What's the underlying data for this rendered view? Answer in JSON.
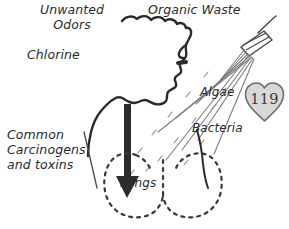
{
  "figure": {
    "background_color": "#ffffff",
    "ink_color": "#2b2b2b"
  },
  "labels": {
    "unwanted_odors": "Unwanted\nOdors",
    "chlorine": "Chlorine",
    "organic_waste": "Organic Waste",
    "algae": "Algae",
    "bacteria": "Bacteria",
    "common_carcinogens": "Common\nCarcinogens\nand toxins",
    "lungs": "Lungs"
  },
  "badge": {
    "number": "119",
    "shape": "heart",
    "fill_color": "#d8d8d8",
    "stroke_color": "#6e6e6e",
    "text_color": "#3a3a3a"
  },
  "graphics": {
    "head_silhouette": "head-profile-outline",
    "shower_head": "shower-head-icon",
    "spray_lines": "water-spray-lines",
    "inhalation_arrow": "down-arrow",
    "lungs_outline": "dashed-lungs-outline"
  }
}
